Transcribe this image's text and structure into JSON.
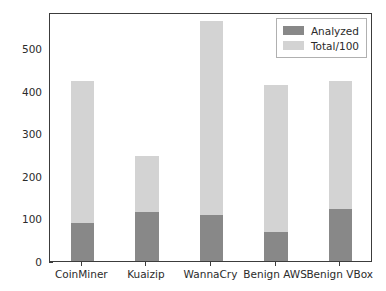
{
  "chart_data": {
    "type": "bar",
    "subtype": "stacked",
    "title": "",
    "xlabel": "",
    "ylabel": "Number of events",
    "categories": [
      "CoinMiner",
      "Kuaizip",
      "WannaCry",
      "Benign AWS",
      "Benign VBox"
    ],
    "series": [
      {
        "name": "Analyzed",
        "color": "#888888",
        "values": [
          89,
          116,
          109,
          69,
          122
        ]
      },
      {
        "name": "Total/100",
        "color": "#d3d3d3",
        "values": [
          335,
          131,
          455,
          345,
          302
        ]
      }
    ],
    "stack_totals": [
      424,
      247,
      564,
      414,
      424
    ],
    "ylim": [
      0,
      586
    ],
    "yticks": [
      0,
      100,
      200,
      300,
      400,
      500
    ],
    "ytick_labels": [
      "0",
      "100",
      "200",
      "300",
      "400",
      "500"
    ],
    "grid": false,
    "legend_position": "upper right",
    "legend_entries": [
      "Analyzed",
      "Total/100"
    ],
    "bar_width_fraction": 0.36
  },
  "legend": {
    "items": [
      {
        "label": "Analyzed",
        "color": "#888888"
      },
      {
        "label": "Total/100",
        "color": "#d3d3d3"
      }
    ]
  }
}
